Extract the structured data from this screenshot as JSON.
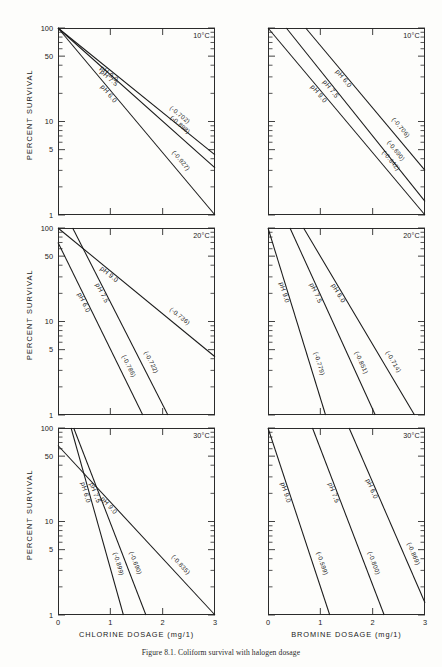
{
  "figure": {
    "caption": "Figure 8.1. Coliform survival with halogen dosage",
    "ylabel": "PERCENT SURVIVAL",
    "y_ticks": [
      "100",
      "50",
      "10",
      "5",
      "1"
    ],
    "x_ticks": [
      "0",
      "1",
      "2",
      "3"
    ],
    "xlabel_chlorine": "CHLORINE DOSAGE (mg/1)",
    "xlabel_bromine": "BROMINE DOSAGE (mg/1)",
    "temps": [
      "10°C",
      "20°C",
      "30°C"
    ]
  },
  "chart_data": [
    {
      "type": "line",
      "title": "Chlorine 10°C",
      "panel": "chlorine-10",
      "xlabel": "CHLORINE DOSAGE (mg/1)",
      "ylabel": "PERCENT SURVIVAL",
      "xlim": [
        0,
        3
      ],
      "ylim": [
        1,
        100
      ],
      "yscale": "log",
      "grid": false,
      "legend": "inline-curve-labels",
      "annotation": "10°C",
      "series": [
        {
          "name": "pH 6.0",
          "label": "pH 6.0",
          "slope_label": "(-0.927)",
          "slope": -0.927,
          "x": [
            0,
            3
          ],
          "y": [
            100,
            1
          ]
        },
        {
          "name": "pH 7.5",
          "label": "pH 7.5",
          "slope_label": "(-0.898)",
          "slope": -0.898,
          "x": [
            0,
            3
          ],
          "y": [
            100,
            3.2
          ]
        },
        {
          "name": "pH 9.0",
          "label": "pH 9.0",
          "slope_label": "(-0.702)",
          "slope": -0.702,
          "x": [
            0,
            3
          ],
          "y": [
            100,
            4.4
          ]
        }
      ]
    },
    {
      "type": "line",
      "title": "Bromine 10°C",
      "panel": "bromine-10",
      "xlabel": "BROMINE DOSAGE (mg/1)",
      "ylabel": "PERCENT SURVIVAL",
      "xlim": [
        0,
        3
      ],
      "ylim": [
        1,
        100
      ],
      "yscale": "log",
      "grid": false,
      "legend": "inline-curve-labels",
      "annotation": "10°C",
      "series": [
        {
          "name": "pH 9.0",
          "label": "pH 9.0",
          "slope_label": "(-0.642)",
          "slope": -0.642,
          "x": [
            0,
            3
          ],
          "y": [
            100,
            1
          ]
        },
        {
          "name": "pH 7.5",
          "label": "pH 7.5",
          "slope_label": "(-0.690)",
          "slope": -0.69,
          "x": [
            0.35,
            3
          ],
          "y": [
            100,
            1.4
          ]
        },
        {
          "name": "pH 6.0",
          "label": "pH 6.0",
          "slope_label": "(-0.706)",
          "slope": -0.706,
          "x": [
            0.72,
            3
          ],
          "y": [
            100,
            3.0
          ]
        }
      ]
    },
    {
      "type": "line",
      "title": "Chlorine 20°C",
      "panel": "chlorine-20",
      "xlabel": "CHLORINE DOSAGE (mg/1)",
      "ylabel": "PERCENT SURVIVAL",
      "xlim": [
        0,
        3
      ],
      "ylim": [
        1,
        100
      ],
      "yscale": "log",
      "grid": false,
      "legend": "inline-curve-labels",
      "annotation": "20°C",
      "series": [
        {
          "name": "pH 6.0",
          "label": "pH 6.0",
          "slope_label": "(-0.786)",
          "slope": -0.786,
          "x": [
            0,
            1.62
          ],
          "y": [
            70,
            1
          ]
        },
        {
          "name": "pH 7.5",
          "label": "pH 7.5",
          "slope_label": "(-0.722)",
          "slope": -0.722,
          "x": [
            0.28,
            2.1
          ],
          "y": [
            100,
            1
          ]
        },
        {
          "name": "pH 9.0",
          "label": "pH 9.0",
          "slope_label": "(-0.736)",
          "slope": -0.736,
          "x": [
            0,
            3
          ],
          "y": [
            100,
            4.2
          ]
        }
      ]
    },
    {
      "type": "line",
      "title": "Bromine 20°C",
      "panel": "bromine-20",
      "xlabel": "BROMINE DOSAGE (mg/1)",
      "ylabel": "PERCENT SURVIVAL",
      "xlim": [
        0,
        3
      ],
      "ylim": [
        1,
        100
      ],
      "yscale": "log",
      "grid": false,
      "legend": "inline-curve-labels",
      "annotation": "20°C",
      "series": [
        {
          "name": "pH 9.0",
          "label": "pH 9.0",
          "slope_label": "(-0.779)",
          "slope": -0.779,
          "x": [
            0,
            1.1
          ],
          "y": [
            100,
            1
          ]
        },
        {
          "name": "pH 7.5",
          "label": "pH 7.5",
          "slope_label": "(-0.851)",
          "slope": -0.851,
          "x": [
            0.42,
            2.05
          ],
          "y": [
            100,
            1
          ]
        },
        {
          "name": "pH 6.0",
          "label": "pH 6.0",
          "slope_label": "(-0.714)",
          "slope": -0.714,
          "x": [
            0.68,
            2.8
          ],
          "y": [
            100,
            1
          ]
        }
      ]
    },
    {
      "type": "line",
      "title": "Chlorine 30°C",
      "panel": "chlorine-30",
      "xlabel": "CHLORINE DOSAGE (mg/1)",
      "ylabel": "PERCENT SURVIVAL",
      "xlim": [
        0,
        3
      ],
      "ylim": [
        1,
        100
      ],
      "yscale": "log",
      "grid": false,
      "legend": "inline-curve-labels",
      "annotation": "30°C",
      "series": [
        {
          "name": "pH 6.0",
          "label": "pH 6.0",
          "slope_label": "(-0.899)",
          "slope": -0.899,
          "x": [
            0.25,
            1.25
          ],
          "y": [
            100,
            1
          ]
        },
        {
          "name": "pH 7.5",
          "label": "pH 7.5",
          "slope_label": "(-0.690)",
          "slope": -0.69,
          "x": [
            0.3,
            1.68
          ],
          "y": [
            100,
            1
          ]
        },
        {
          "name": "pH 9.0",
          "label": "pH 9.0",
          "slope_label": "(-0.835)",
          "slope": -0.835,
          "x": [
            0,
            3
          ],
          "y": [
            65,
            1
          ]
        }
      ]
    },
    {
      "type": "line",
      "title": "Bromine 30°C",
      "panel": "bromine-30",
      "xlabel": "BROMINE DOSAGE (mg/1)",
      "ylabel": "PERCENT SURVIVAL",
      "xlim": [
        0,
        3
      ],
      "ylim": [
        1,
        100
      ],
      "yscale": "log",
      "grid": false,
      "legend": "inline-curve-labels",
      "annotation": "30°C",
      "series": [
        {
          "name": "pH 9.0",
          "label": "pH 9.0",
          "slope_label": "(-0.599)",
          "slope": -0.599,
          "x": [
            0,
            1.18
          ],
          "y": [
            100,
            1
          ]
        },
        {
          "name": "pH 7.5",
          "label": "pH 7.5",
          "slope_label": "(-0.800)",
          "slope": -0.8,
          "x": [
            0.85,
            2.22
          ],
          "y": [
            100,
            1
          ]
        },
        {
          "name": "pH 6.0",
          "label": "pH 6.0",
          "slope_label": "(-0.869)",
          "slope": -0.869,
          "x": [
            1.55,
            3
          ],
          "y": [
            100,
            1.35
          ]
        }
      ]
    }
  ]
}
